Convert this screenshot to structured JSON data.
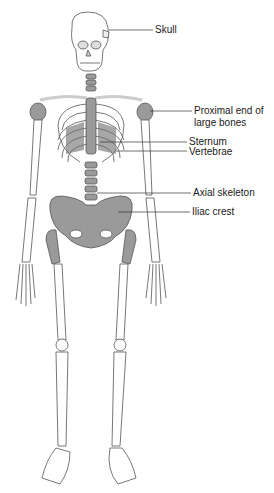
{
  "figure": {
    "colors": {
      "highlight": "#9a9a9a",
      "bone": "#ffffff",
      "outline": "#555555",
      "leader": "#333333",
      "rib_shade": "#6e6e6e"
    },
    "labels": [
      {
        "id": "skull",
        "text": "Skull"
      },
      {
        "id": "proximal",
        "line1": "Proximal end of",
        "line2": "large bones"
      },
      {
        "id": "sternum",
        "text": "Sternum"
      },
      {
        "id": "vertebrae",
        "text": "Vertebrae"
      },
      {
        "id": "axial",
        "text": "Axial skeleton"
      },
      {
        "id": "iliac",
        "text": "Iliac crest"
      }
    ]
  }
}
